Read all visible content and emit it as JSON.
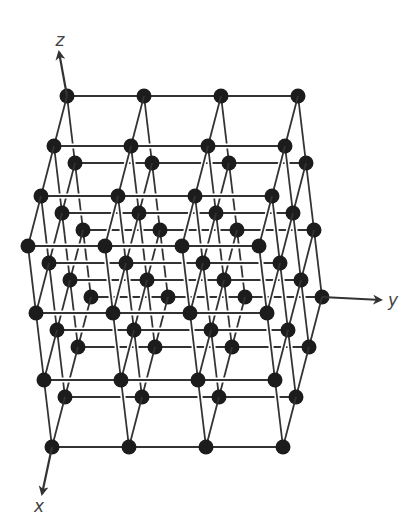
{
  "figure": {
    "background": "#ffffff"
  },
  "lattice": {
    "type": "simple-cubic",
    "counts": {
      "x": 4,
      "y": 4,
      "z": 4
    },
    "origin_px": [
      91,
      297
    ],
    "step_x_px": [
      -13,
      50
    ],
    "step_y_px": [
      77,
      0
    ],
    "step_z_px": [
      -8,
      -67
    ],
    "atom_radius": 7.5,
    "atom_color": "#1c1c1c",
    "bond_color": "#333333",
    "bond_width": 1.8,
    "halo_color": "#ffffff",
    "halo_width": 5
  },
  "axes": [
    {
      "name": "z",
      "label": "z",
      "from_atom": [
        0,
        0,
        3
      ],
      "tip_px": [
        59,
        52
      ],
      "label_px": [
        60,
        46
      ]
    },
    {
      "name": "y",
      "label": "y",
      "from_atom": [
        0,
        3,
        0
      ],
      "tip_px": [
        381,
        300
      ],
      "label_px": [
        388,
        306
      ]
    },
    {
      "name": "x",
      "label": "x",
      "from_atom": [
        3,
        0,
        0
      ],
      "tip_px": [
        42,
        494
      ],
      "label_px": [
        39,
        512
      ]
    }
  ],
  "axis_color": "#333333"
}
